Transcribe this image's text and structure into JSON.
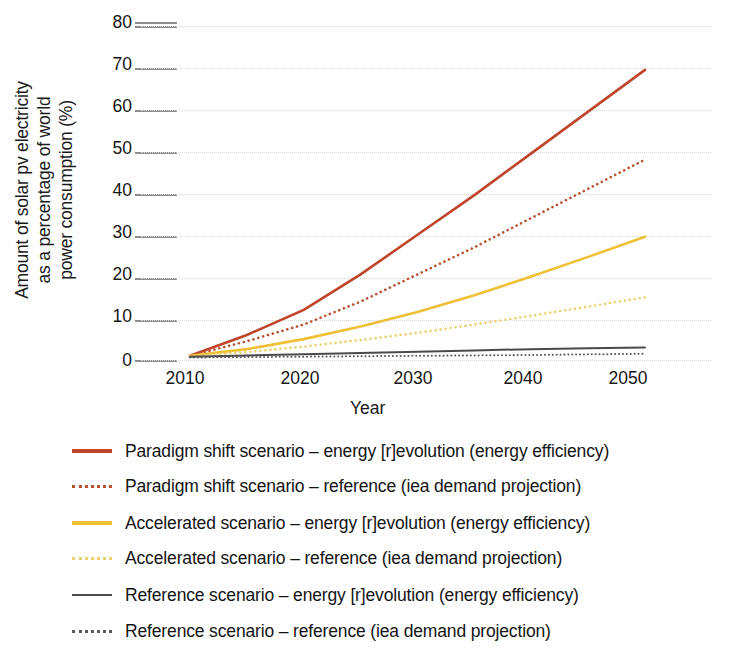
{
  "chart_data": {
    "type": "line",
    "title": "",
    "xlabel": "Year",
    "ylabel": "Amount of solar pv electricity as a percentage of world power consumption (%)",
    "ylabel_lines": [
      "Amount of solar pv electricity",
      "as a percentage of world",
      "power consumption (%)"
    ],
    "xlim": [
      2008,
      2052
    ],
    "ylim": [
      0,
      80
    ],
    "x_ticks": [
      2010,
      2020,
      2030,
      2040,
      2050
    ],
    "y_ticks": [
      0,
      10,
      20,
      30,
      40,
      50,
      60,
      70,
      80
    ],
    "grid": "dotted horizontal gridlines, light gray",
    "legend_position": "below plot, left aligned",
    "x": [
      2010,
      2015,
      2020,
      2025,
      2030,
      2035,
      2040,
      2045,
      2050
    ],
    "series": [
      {
        "name": "Paradigm shift scenario – energy [r]evolution (energy efficiency)",
        "style": "solid",
        "color": "#C0442A",
        "values": [
          1.0,
          6.0,
          12.0,
          20.5,
          30.0,
          39.5,
          49.5,
          59.5,
          69.5
        ]
      },
      {
        "name": "Paradigm shift scenario – reference (iea demand projection)",
        "style": "dotted",
        "color": "#B7502F",
        "values": [
          1.0,
          4.5,
          8.5,
          14.0,
          20.5,
          27.0,
          34.0,
          41.0,
          48.0
        ]
      },
      {
        "name": "Accelerated scenario – energy [r]evolution (energy efficiency)",
        "style": "solid",
        "color": "#EFBF36",
        "values": [
          1.0,
          2.6,
          5.0,
          8.0,
          11.5,
          15.5,
          20.0,
          24.7,
          29.5
        ]
      },
      {
        "name": "Accelerated scenario – reference (iea demand projection)",
        "style": "dotted",
        "color": "#EAD26F",
        "values": [
          1.0,
          1.9,
          3.2,
          4.8,
          6.5,
          8.5,
          10.6,
          12.8,
          15.0
        ]
      },
      {
        "name": "Reference scenario – energy [r]evolution (energy efficiency)",
        "style": "solid",
        "color": "#4A4A4A",
        "values": [
          0.8,
          1.1,
          1.4,
          1.7,
          2.0,
          2.3,
          2.6,
          2.8,
          3.0
        ]
      },
      {
        "name": "Reference scenario – reference (iea demand projection)",
        "style": "dotted",
        "color": "#5A5A5A",
        "values": [
          0.6,
          0.7,
          0.8,
          0.9,
          1.0,
          1.1,
          1.2,
          1.35,
          1.5
        ]
      }
    ]
  },
  "legend": {
    "items": [
      {
        "label": "Paradigm shift scenario – energy [r]evolution (energy efficiency)",
        "color": "#C0442A",
        "style": "solid"
      },
      {
        "label": "Paradigm shift scenario – reference (iea demand projection)",
        "color": "#B7502F",
        "style": "dotted"
      },
      {
        "label": "Accelerated scenario – energy [r]evolution (energy efficiency)",
        "color": "#EFBF36",
        "style": "solid"
      },
      {
        "label": "Accelerated scenario – reference (iea demand projection)",
        "color": "#EAD26F",
        "style": "dotted"
      },
      {
        "label": "Reference scenario – energy [r]evolution (energy efficiency)",
        "color": "#4A4A4A",
        "style": "solid"
      },
      {
        "label": "Reference scenario – reference (iea demand projection)",
        "color": "#5A5A5A",
        "style": "dotted"
      }
    ]
  },
  "axes": {
    "x_tick_labels": [
      "2010",
      "2020",
      "2030",
      "2040",
      "2050"
    ],
    "y_tick_labels": [
      "80",
      "70",
      "60",
      "50",
      "40",
      "30",
      "20",
      "10",
      "0"
    ],
    "x_title": "Year",
    "y_title_lines": [
      "Amount of solar pv electricity",
      "as a percentage of world",
      "power consumption (%)"
    ]
  },
  "colors": {
    "paradigm": "#C0442A",
    "accelerated": "#EFBF36",
    "reference": "#4A4A4A",
    "gridline": "#d8d8d8",
    "tick": "#8d8d8d",
    "text": "#141414"
  }
}
